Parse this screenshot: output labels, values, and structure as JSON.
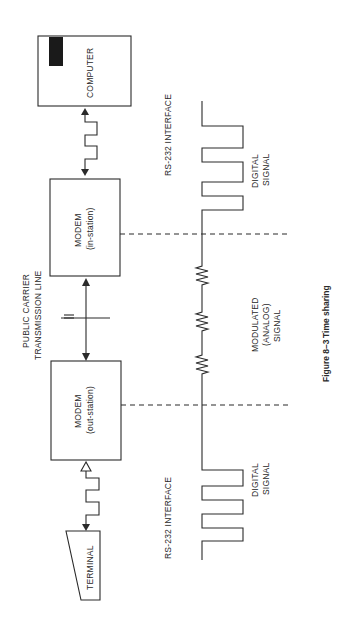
{
  "figure": {
    "caption_number": "Figure 8–3",
    "caption_title": "Time sharing",
    "orientation": "rotated 90° counter-clockwise"
  },
  "nodes": {
    "computer": {
      "label": "COMPUTER"
    },
    "modem_in": {
      "label": "MODEM",
      "sublabel": "(in-station)"
    },
    "modem_out": {
      "label": "MODEM",
      "sublabel": "(out-station)"
    },
    "terminal": {
      "label": "TERMINAL"
    }
  },
  "links": {
    "transmission_line_label_1": "PUBLIC CARRIER",
    "transmission_line_label_2": "TRANSMISSION LINE"
  },
  "interfaces": {
    "top": "RS-232 INTERFACE",
    "bottom": "RS-232 INTERFACE"
  },
  "signals": {
    "top_digital_1": "DIGITAL",
    "top_digital_2": "SIGNAL",
    "modulated_1": "MODULATED",
    "modulated_2": "(ANALOG)",
    "modulated_3": "SIGNAL",
    "bottom_digital_1": "DIGITAL",
    "bottom_digital_2": "SIGNAL"
  },
  "colors": {
    "ink": "#2a2a2a",
    "background": "#ffffff"
  }
}
